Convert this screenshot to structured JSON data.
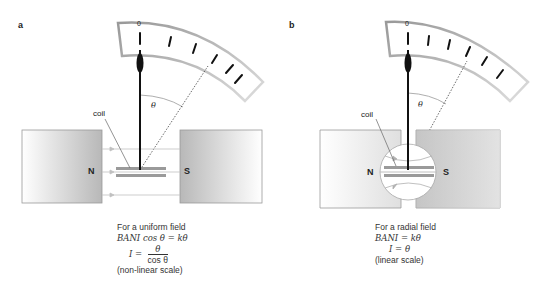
{
  "panels": [
    {
      "label": "a",
      "scale_zero": "0",
      "coil_label": "coil",
      "theta": "θ",
      "pole_n": "N",
      "pole_s": "S",
      "caption": {
        "line1": "For a uniform field",
        "eq1": "BANI cos θ = kθ",
        "eq2_lhs": "I =",
        "eq2_num": "θ",
        "eq2_den": "cos θ",
        "note": "(non-linear scale)"
      }
    },
    {
      "label": "b",
      "scale_zero": "0",
      "coil_label": "coil",
      "theta": "θ",
      "pole_n": "N",
      "pole_s": "S",
      "caption": {
        "line1": "For a radial field",
        "eq1": "BANI = kθ",
        "eq2": "I = θ",
        "note": "(linear scale)"
      }
    }
  ],
  "colors": {
    "magnet": "#bdbdbd",
    "coil": "#9a9a9a",
    "needle": "#111111",
    "field_line": "#b0b0b0"
  }
}
